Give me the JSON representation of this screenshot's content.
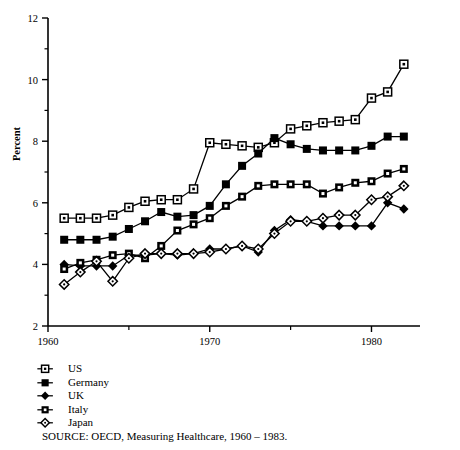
{
  "chart_data": {
    "type": "line",
    "title": "",
    "xlabel": "",
    "ylabel": "Percent",
    "xlim": [
      1960,
      1983
    ],
    "ylim": [
      2,
      12
    ],
    "grid": false,
    "legend_position": "below-left",
    "xticks": [
      1960,
      1970,
      1980
    ],
    "xtick_labels": [
      "1960",
      "1970",
      "1980"
    ],
    "xminorticks": [
      1965,
      1975
    ],
    "yticks": [
      2,
      4,
      6,
      8,
      10,
      12
    ],
    "ytick_labels": [
      "2",
      "4",
      "6",
      "8",
      "10",
      "12"
    ],
    "yminorticks": [
      3,
      5,
      7,
      9,
      11
    ],
    "x": [
      1961,
      1962,
      1963,
      1964,
      1965,
      1966,
      1967,
      1968,
      1969,
      1970,
      1971,
      1972,
      1973,
      1974,
      1975,
      1976,
      1977,
      1978,
      1979,
      1980,
      1981,
      1982
    ],
    "series": [
      {
        "name": "US",
        "marker": "open-square",
        "values": [
          5.5,
          5.5,
          5.5,
          5.6,
          5.85,
          6.05,
          6.1,
          6.1,
          6.45,
          7.95,
          7.9,
          7.85,
          7.8,
          7.95,
          8.4,
          8.5,
          8.6,
          8.65,
          8.7,
          9.4,
          9.6,
          10.5
        ]
      },
      {
        "name": "Germany",
        "marker": "filled-square",
        "values": [
          4.8,
          4.8,
          4.8,
          4.9,
          5.15,
          5.4,
          5.7,
          5.55,
          5.6,
          5.9,
          6.6,
          7.2,
          7.6,
          8.1,
          7.9,
          7.75,
          7.7,
          7.7,
          7.7,
          7.85,
          8.15,
          8.15
        ]
      },
      {
        "name": "UK",
        "marker": "filled-diamond",
        "values": [
          4.0,
          3.95,
          3.95,
          3.95,
          4.3,
          4.3,
          4.35,
          4.3,
          4.35,
          4.5,
          4.5,
          4.6,
          4.4,
          5.1,
          5.45,
          5.4,
          5.25,
          5.25,
          5.25,
          5.25,
          6.0,
          5.8
        ]
      },
      {
        "name": "Italy",
        "marker": "filled-square-open-center",
        "values": [
          3.85,
          4.05,
          4.15,
          4.3,
          4.35,
          4.2,
          4.6,
          5.1,
          5.3,
          5.5,
          5.9,
          6.2,
          6.55,
          6.6,
          6.6,
          6.6,
          6.3,
          6.5,
          6.65,
          6.7,
          6.95,
          7.1
        ]
      },
      {
        "name": "Japan",
        "marker": "open-diamond",
        "values": [
          3.35,
          3.75,
          4.1,
          3.45,
          4.2,
          4.35,
          4.35,
          4.35,
          4.35,
          4.4,
          4.5,
          4.6,
          4.5,
          5.0,
          5.4,
          5.4,
          5.5,
          5.6,
          5.6,
          6.1,
          6.2,
          6.55
        ]
      }
    ],
    "source_note": "SOURCE:  OECD, Measuring Healthcare, 1960 – 1983."
  },
  "legend": {
    "items": [
      {
        "label": "US"
      },
      {
        "label": "Germany"
      },
      {
        "label": "UK"
      },
      {
        "label": "Italy"
      },
      {
        "label": "Japan"
      }
    ]
  },
  "colors": {
    "ink": "#000000",
    "background": "#ffffff",
    "axis": "#1a1a1a"
  }
}
